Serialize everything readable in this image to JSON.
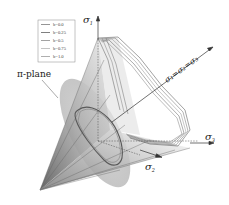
{
  "figure": {
    "type": "3D yield surface diagram in principal stress space",
    "axes": {
      "sigma1": {
        "label": "σ",
        "sub": "1"
      },
      "sigma2": {
        "label": "σ",
        "sub": "2"
      },
      "sigma3": {
        "label": "σ",
        "sub": "3"
      },
      "hydrostatic": {
        "label": "σ₁=σ₂=σ₃"
      }
    },
    "pi_plane_label": "π-plane",
    "legend": {
      "entries": [
        {
          "label": "b=0.0",
          "color": "#7a7a7a"
        },
        {
          "label": "b=0.25",
          "color": "#5e5e5e"
        },
        {
          "label": "b=0.5",
          "color": "#8c8c8c"
        },
        {
          "label": "b=0.75",
          "color": "#b5b5b5"
        },
        {
          "label": "b=1.0",
          "color": "#9a9a9a"
        }
      ]
    },
    "colors": {
      "surface_dark": "#6e6e6e",
      "surface_light": "#d9d9d9",
      "pi_plane": "#bdbdbd",
      "edges": "#555555",
      "axis": "#333333"
    }
  }
}
